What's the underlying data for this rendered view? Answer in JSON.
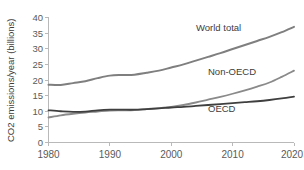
{
  "chart_data": {
    "type": "line",
    "title": "",
    "xlabel": "",
    "ylabel": "CO2 emissions/year (billions)",
    "xlim": [
      1980,
      2020
    ],
    "ylim": [
      0,
      40
    ],
    "grid": false,
    "legend_position": "inline-annotations",
    "x_ticks": [
      "1980",
      "1990",
      "2000",
      "2010",
      "2020"
    ],
    "y_ticks": [
      "0",
      "5",
      "10",
      "15",
      "20",
      "25",
      "30",
      "35",
      "40"
    ],
    "x": [
      1980,
      1982,
      1984,
      1986,
      1988,
      1990,
      1992,
      1994,
      1996,
      1998,
      2000,
      2002,
      2004,
      2006,
      2008,
      2010,
      2012,
      2014,
      2016,
      2018,
      2020
    ],
    "series": [
      {
        "name": "World total",
        "color": "#7f7f7f",
        "values": [
          18.5,
          18.4,
          19.0,
          19.6,
          20.6,
          21.4,
          21.6,
          21.7,
          22.3,
          23.0,
          24.0,
          25.0,
          26.2,
          27.4,
          28.6,
          29.9,
          31.2,
          32.5,
          33.8,
          35.3,
          37.0
        ]
      },
      {
        "name": "Non-OECD",
        "color": "#8a8a8a",
        "values": [
          8.0,
          8.7,
          9.2,
          9.6,
          9.9,
          10.2,
          10.3,
          10.4,
          10.7,
          11.0,
          11.4,
          12.0,
          12.8,
          13.7,
          14.6,
          15.6,
          16.7,
          17.9,
          19.2,
          21.0,
          23.0
        ]
      },
      {
        "name": "OECD",
        "color": "#3f3f3f",
        "values": [
          10.3,
          10.0,
          9.8,
          9.9,
          10.3,
          10.5,
          10.5,
          10.5,
          10.7,
          10.9,
          11.2,
          11.4,
          11.7,
          12.0,
          12.3,
          12.6,
          12.9,
          13.2,
          13.6,
          14.1,
          14.7
        ]
      }
    ],
    "annotations": [
      {
        "text": "World total",
        "x": 2004,
        "y": 36.5
      },
      {
        "text": "Non-OECD",
        "x": 2008,
        "y": 23.2
      },
      {
        "text": "OECD",
        "x": 2008,
        "y": 11.6
      }
    ]
  }
}
